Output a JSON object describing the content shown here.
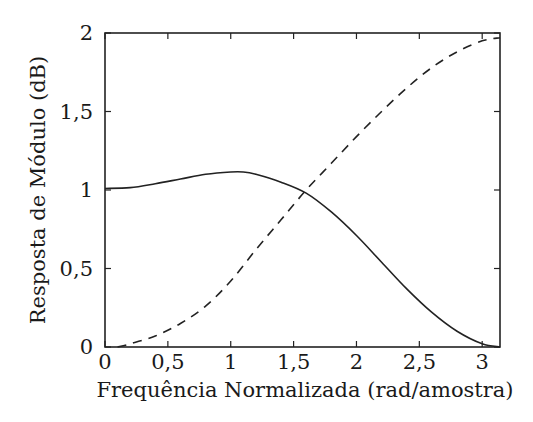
{
  "chart_data": {
    "type": "line",
    "title": "",
    "xlabel": "Frequência Normalizada (rad/amostra)",
    "ylabel": "Resposta de Módulo (dB)",
    "xlim": [
      0,
      3.1416
    ],
    "ylim": [
      0,
      2
    ],
    "xticks": [
      0,
      0.5,
      1,
      1.5,
      2,
      2.5,
      3
    ],
    "xtick_labels": [
      "0",
      "0,5",
      "1",
      "1,5",
      "2",
      "2,5",
      "3"
    ],
    "yticks": [
      0,
      0.5,
      1,
      1.5,
      2
    ],
    "ytick_labels": [
      "0",
      "0,5",
      "1",
      "1,5",
      "2"
    ],
    "grid": false,
    "legend": null,
    "series": [
      {
        "name": "passa-baixas",
        "style": "solid",
        "x": [
          0,
          0.2,
          0.4,
          0.6,
          0.8,
          1.0,
          1.1,
          1.2,
          1.4,
          1.6,
          1.8,
          2.0,
          2.2,
          2.4,
          2.6,
          2.8,
          3.0,
          3.1416
        ],
        "values": [
          1.01,
          1.015,
          1.04,
          1.07,
          1.1,
          1.115,
          1.115,
          1.1,
          1.05,
          0.98,
          0.86,
          0.71,
          0.54,
          0.37,
          0.22,
          0.1,
          0.02,
          0.0
        ]
      },
      {
        "name": "passa-altas",
        "style": "dashed",
        "x": [
          0.1,
          0.2,
          0.4,
          0.6,
          0.8,
          1.0,
          1.2,
          1.4,
          1.6,
          1.8,
          2.0,
          2.2,
          2.4,
          2.6,
          2.8,
          3.0,
          3.1416
        ],
        "values": [
          0.0,
          0.02,
          0.07,
          0.15,
          0.26,
          0.42,
          0.62,
          0.81,
          1.0,
          1.17,
          1.34,
          1.5,
          1.65,
          1.78,
          1.88,
          1.95,
          1.97
        ]
      }
    ]
  }
}
